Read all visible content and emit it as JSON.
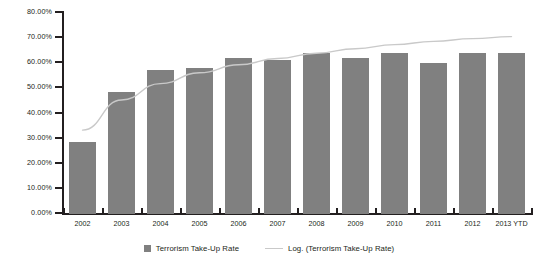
{
  "chart_data": {
    "type": "bar",
    "title": "",
    "xlabel": "",
    "ylabel": "",
    "categories": [
      "2002",
      "2003",
      "2004",
      "2005",
      "2006",
      "2007",
      "2008",
      "2009",
      "2010",
      "2011",
      "2012",
      "2013 YTD"
    ],
    "values": [
      28.8,
      48.5,
      57.3,
      58.0,
      62.0,
      61.2,
      64.2,
      62.0,
      64.2,
      60.2,
      64.0,
      64.0
    ],
    "series": [
      {
        "name": "Terrorism Take-Up Rate",
        "type": "bar",
        "color": "#808080",
        "values": [
          28.8,
          48.5,
          57.3,
          58.0,
          62.0,
          61.2,
          64.2,
          62.0,
          64.2,
          60.2,
          64.0,
          64.0
        ]
      },
      {
        "name": "Log. (Terrorism Take-Up Rate)",
        "type": "line",
        "color": "#c9c9c9",
        "values": [
          33.0,
          45.0,
          51.5,
          55.8,
          59.0,
          61.5,
          63.6,
          65.4,
          67.0,
          68.3,
          69.4,
          70.2
        ]
      }
    ],
    "ylim": [
      0,
      80
    ],
    "yticks": [
      0,
      10,
      20,
      30,
      40,
      50,
      60,
      70,
      80
    ],
    "ytick_labels": [
      "0.00%",
      "10.00%",
      "20.00%",
      "30.00%",
      "40.00%",
      "50.00%",
      "60.00%",
      "70.00%",
      "80.00%"
    ],
    "grid": false,
    "legend_position": "bottom"
  },
  "legend": {
    "items": [
      {
        "label": "Terrorism Take-Up Rate",
        "marker": "square-swatch",
        "color": "#808080"
      },
      {
        "label": "Log. (Terrorism Take-Up Rate)",
        "marker": "line-swatch",
        "color": "#c9c9c9"
      }
    ]
  },
  "colors": {
    "bar": "#808080",
    "trend_line": "#c9c9c9",
    "axis": "#231f20",
    "background": "#ffffff"
  }
}
